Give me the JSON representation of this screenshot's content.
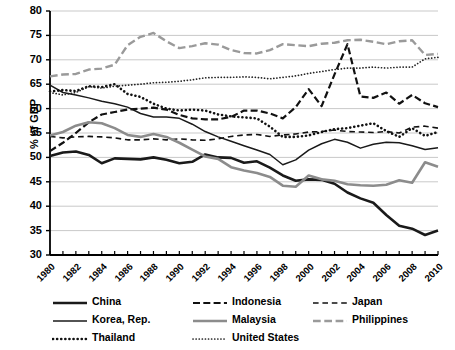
{
  "axis": {
    "ylabel": "% of GDP",
    "yticks": [
      "80",
      "75",
      "70",
      "65",
      "60",
      "55",
      "50",
      "45",
      "40",
      "35",
      "30"
    ],
    "xticks": [
      "1980",
      "1982",
      "1984",
      "1986",
      "1988",
      "1990",
      "1992",
      "1994",
      "1996",
      "1998",
      "2000",
      "2002",
      "2004",
      "2006",
      "2008",
      "2010"
    ]
  },
  "legend": {
    "rows": [
      [
        {
          "label": "China",
          "key": "china"
        },
        {
          "label": "Indonesia",
          "key": "indonesia"
        },
        {
          "label": "Japan",
          "key": "japan"
        }
      ],
      [
        {
          "label": "Korea, Rep.",
          "key": "korea"
        },
        {
          "label": "Malaysia",
          "key": "malaysia"
        },
        {
          "label": "Philippines",
          "key": "philippines"
        }
      ],
      [
        {
          "label": "Thailand",
          "key": "thailand"
        },
        {
          "label": "United States",
          "key": "united_states"
        }
      ]
    ]
  },
  "chart_data": {
    "type": "line",
    "title": "",
    "xlabel": "",
    "ylabel": "% of GDP",
    "ylim": [
      30,
      80
    ],
    "ytick_step": 5,
    "grid": true,
    "legend_position": "bottom",
    "x": [
      1980,
      1981,
      1982,
      1983,
      1984,
      1985,
      1986,
      1987,
      1988,
      1989,
      1990,
      1991,
      1992,
      1993,
      1994,
      1995,
      1996,
      1997,
      1998,
      1999,
      2000,
      2001,
      2002,
      2003,
      2004,
      2005,
      2006,
      2007,
      2008,
      2009,
      2010
    ],
    "series": [
      {
        "name": "China",
        "color": "#1a1a1a",
        "style": "solid",
        "width": 2.6,
        "values": [
          50.3,
          51.0,
          51.2,
          50.5,
          48.8,
          49.8,
          49.7,
          49.6,
          50.0,
          49.5,
          48.8,
          49.1,
          50.6,
          50.0,
          49.9,
          48.9,
          49.2,
          47.9,
          46.3,
          45.2,
          45.5,
          45.4,
          44.6,
          42.8,
          41.6,
          40.7,
          38.2,
          36.0,
          35.4,
          34.1,
          35.0
        ]
      },
      {
        "name": "Indonesia",
        "color": "#111111",
        "style": "dashed-long",
        "width": 2.2,
        "values": [
          51.3,
          53.0,
          55.0,
          57.2,
          58.8,
          59.3,
          59.8,
          60.0,
          60.2,
          59.8,
          58.7,
          58.0,
          57.8,
          57.8,
          58.3,
          59.6,
          59.6,
          59.0,
          58.0,
          60.3,
          64.0,
          60.5,
          67.0,
          73.2,
          62.5,
          62.2,
          63.3,
          61.0,
          62.8,
          61.1,
          60.3
        ]
      },
      {
        "name": "Japan",
        "color": "#111111",
        "style": "dashed-short",
        "width": 1.6,
        "values": [
          54.3,
          54.0,
          54.2,
          54.3,
          54.2,
          54.0,
          53.6,
          53.6,
          53.8,
          53.6,
          53.8,
          53.6,
          53.5,
          53.8,
          54.3,
          54.6,
          54.7,
          54.3,
          54.6,
          54.8,
          55.2,
          55.3,
          55.6,
          55.3,
          55.2,
          55.1,
          55.3,
          55.0,
          56.2,
          56.4,
          56.0
        ]
      },
      {
        "name": "Korea, Rep.",
        "color": "#1a1a1a",
        "style": "solid",
        "width": 1.5,
        "values": [
          64.8,
          63.3,
          62.8,
          62.2,
          61.5,
          61.0,
          60.3,
          59.0,
          58.3,
          58.3,
          58.0,
          56.8,
          55.3,
          54.2,
          53.3,
          52.4,
          51.5,
          50.6,
          48.5,
          49.5,
          51.5,
          52.8,
          53.7,
          53.1,
          51.9,
          52.7,
          53.1,
          53.0,
          52.4,
          51.6,
          52.0
        ]
      },
      {
        "name": "Malaysia",
        "color": "#8c8c8c",
        "style": "solid",
        "width": 2.6,
        "values": [
          54.5,
          55.2,
          56.5,
          57.2,
          57.0,
          56.0,
          54.6,
          54.2,
          54.8,
          54.2,
          53.0,
          51.6,
          50.2,
          49.7,
          48.0,
          47.3,
          46.8,
          46.0,
          44.2,
          44.0,
          46.3,
          45.5,
          45.2,
          44.5,
          44.3,
          44.2,
          44.4,
          45.3,
          44.8,
          49.0,
          48.1
        ]
      },
      {
        "name": "Philippines",
        "color": "#9a9a9a",
        "style": "dashed-long",
        "width": 2.4,
        "values": [
          66.6,
          67.0,
          67.1,
          68.0,
          68.2,
          69.0,
          73.0,
          74.7,
          75.5,
          73.8,
          72.4,
          72.8,
          73.4,
          73.1,
          72.0,
          71.4,
          71.3,
          72.0,
          73.2,
          73.0,
          72.8,
          73.3,
          73.5,
          74.0,
          74.1,
          73.7,
          73.2,
          73.8,
          74.0,
          71.0,
          71.2
        ]
      },
      {
        "name": "Thailand",
        "color": "#111111",
        "style": "dotted-thick",
        "width": 2.6,
        "values": [
          63.5,
          63.8,
          63.6,
          64.6,
          64.4,
          65.0,
          63.0,
          62.4,
          61.0,
          60.0,
          59.6,
          59.8,
          59.6,
          58.8,
          58.4,
          58.2,
          58.0,
          56.3,
          54.2,
          54.2,
          54.5,
          55.2,
          55.8,
          56.0,
          56.5,
          57.0,
          55.4,
          54.2,
          56.0,
          54.4,
          55.2
        ]
      },
      {
        "name": "United States",
        "color": "#222222",
        "style": "dotted-thin",
        "width": 1.7,
        "values": [
          63.3,
          62.8,
          63.3,
          64.5,
          64.2,
          64.6,
          64.8,
          65.0,
          65.3,
          65.4,
          65.6,
          65.9,
          66.3,
          66.4,
          66.4,
          66.5,
          66.4,
          66.1,
          66.4,
          66.7,
          67.2,
          67.6,
          68.0,
          68.3,
          68.3,
          68.5,
          68.3,
          68.5,
          68.5,
          70.2,
          70.5
        ]
      }
    ]
  }
}
